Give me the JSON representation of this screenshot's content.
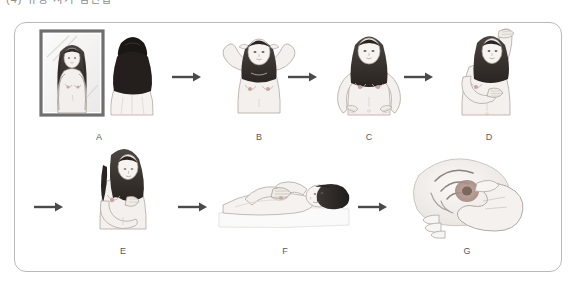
{
  "top_caption": {
    "text": "(4) 유방 자가 검진법",
    "note": "partially cropped at top edge"
  },
  "figure": {
    "border_color": "#b9b9b9",
    "background": "#ffffff",
    "arrow_color": "#4a4a4a",
    "line_color": "#6b6b6b",
    "skin_fill": "#f2efec",
    "hair_fill": "#3a3532",
    "rows": [
      {
        "row": "top",
        "panels": [
          {
            "label": "A",
            "icon": "mirror-inspection-illustration",
            "description": "Woman standing in front of a mirror inspecting both breasts, arms relaxed at sides"
          },
          {
            "label": "B",
            "icon": "hands-behind-head-illustration",
            "description": "Woman with both hands clasped behind her head, chest pushed forward"
          },
          {
            "label": "C",
            "icon": "hands-on-hips-illustration",
            "description": "Woman with both hands pressed firmly on hips, shoulders pulled forward"
          },
          {
            "label": "D",
            "icon": "arm-raised-palpation-illustration",
            "description": "Woman with one arm raised overhead, palpating the opposite breast"
          }
        ]
      },
      {
        "row": "bottom",
        "panels": [
          {
            "label": "E",
            "icon": "nipple-squeeze-illustration",
            "description": "Woman gently squeezing the nipple to check for discharge"
          },
          {
            "label": "F",
            "icon": "lying-down-exam-illustration",
            "description": "Woman lying down flat, examining breast with opposite hand"
          },
          {
            "label": "G",
            "icon": "circular-palpation-closeup-illustration",
            "description": "Close-up of fingers making circular palpation motion over the breast"
          }
        ]
      }
    ],
    "arrows": [
      {
        "name": "arrow-a-to-b",
        "direction": "right"
      },
      {
        "name": "arrow-b-to-c",
        "direction": "right"
      },
      {
        "name": "arrow-c-to-d",
        "direction": "right"
      },
      {
        "name": "arrow-d-to-e",
        "direction": "right"
      },
      {
        "name": "arrow-e-to-f",
        "direction": "right"
      },
      {
        "name": "arrow-f-to-g",
        "direction": "right"
      }
    ]
  }
}
